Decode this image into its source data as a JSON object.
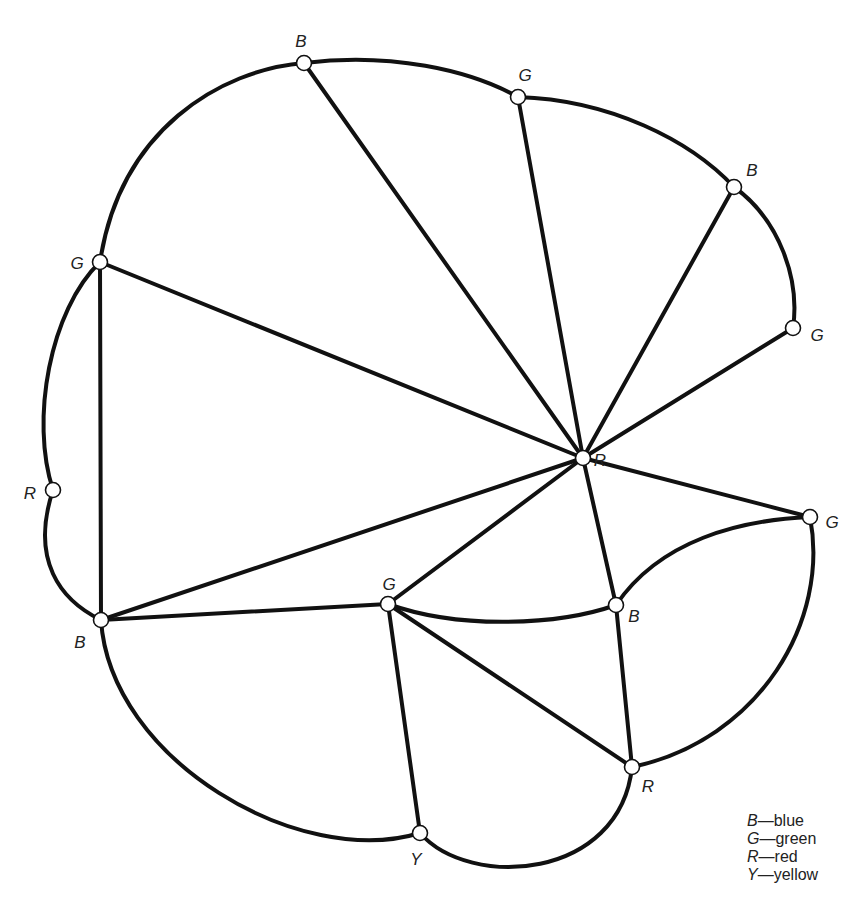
{
  "diagram": {
    "type": "planar-graph-coloring",
    "nodes": [
      {
        "id": "n1",
        "color_letter": "B",
        "x": 304,
        "y": 63,
        "lx": 301,
        "ly": 43
      },
      {
        "id": "n2",
        "color_letter": "G",
        "x": 518,
        "y": 97,
        "lx": 525,
        "ly": 77
      },
      {
        "id": "n3",
        "color_letter": "B",
        "x": 734,
        "y": 187,
        "lx": 752,
        "ly": 172
      },
      {
        "id": "n4",
        "color_letter": "G",
        "x": 793,
        "y": 328,
        "lx": 817,
        "ly": 337
      },
      {
        "id": "n5",
        "color_letter": "G",
        "x": 100,
        "y": 262,
        "lx": 77,
        "ly": 265
      },
      {
        "id": "n6",
        "color_letter": "R",
        "x": 583,
        "y": 458,
        "lx": 600,
        "ly": 462
      },
      {
        "id": "n7",
        "color_letter": "R",
        "x": 53,
        "y": 490,
        "lx": 30,
        "ly": 495
      },
      {
        "id": "n8",
        "color_letter": "G",
        "x": 810,
        "y": 517,
        "lx": 832,
        "ly": 524
      },
      {
        "id": "n9",
        "color_letter": "B",
        "x": 101,
        "y": 620,
        "lx": 80,
        "ly": 644
      },
      {
        "id": "n10",
        "color_letter": "G",
        "x": 388,
        "y": 604,
        "lx": 389,
        "ly": 586
      },
      {
        "id": "n11",
        "color_letter": "B",
        "x": 616,
        "y": 605,
        "lx": 634,
        "ly": 618
      },
      {
        "id": "n12",
        "color_letter": "R",
        "x": 632,
        "y": 767,
        "lx": 648,
        "ly": 788
      },
      {
        "id": "n13",
        "color_letter": "Y",
        "x": 420,
        "y": 833,
        "lx": 416,
        "ly": 861
      }
    ],
    "edges": [
      {
        "from": "n5",
        "to": "n1",
        "path": "M100,262 C120,130 220,70 304,63"
      },
      {
        "from": "n1",
        "to": "n2",
        "path": "M304,63 C390,52 470,70 518,97"
      },
      {
        "from": "n2",
        "to": "n3",
        "path": "M518,97 C610,100 690,140 734,187"
      },
      {
        "from": "n3",
        "to": "n4",
        "path": "M734,187 C780,220 800,280 793,328"
      },
      {
        "from": "n5",
        "to": "n7",
        "path": "M100,262 C50,310 30,420 53,490"
      },
      {
        "from": "n7",
        "to": "n9",
        "path": "M53,490 C30,560 60,600 101,620"
      },
      {
        "from": "n5",
        "to": "n9",
        "path": "M100,262 L101,620"
      },
      {
        "from": "n5",
        "to": "n6",
        "path": "M100,262 L583,458"
      },
      {
        "from": "n1",
        "to": "n6",
        "path": "M304,63 L583,458"
      },
      {
        "from": "n2",
        "to": "n6",
        "path": "M518,97 L583,458"
      },
      {
        "from": "n3",
        "to": "n6",
        "path": "M734,187 L583,458"
      },
      {
        "from": "n4",
        "to": "n6",
        "path": "M793,328 L583,458"
      },
      {
        "from": "n6",
        "to": "n8",
        "path": "M583,458 L810,517"
      },
      {
        "from": "n9",
        "to": "n6",
        "path": "M101,620 L583,458"
      },
      {
        "from": "n10",
        "to": "n6",
        "path": "M388,604 L583,458"
      },
      {
        "from": "n6",
        "to": "n11",
        "path": "M583,458 L616,605"
      },
      {
        "from": "n9",
        "to": "n10",
        "path": "M101,620 L388,604"
      },
      {
        "from": "n10",
        "to": "n11",
        "path": "M388,604 C460,630 560,625 616,605"
      },
      {
        "from": "n11",
        "to": "n8",
        "path": "M616,605 C660,540 740,520 810,517"
      },
      {
        "from": "n8",
        "to": "n12",
        "path": "M810,517 C830,620 760,740 632,767"
      },
      {
        "from": "n11",
        "to": "n12",
        "path": "M616,605 L632,767"
      },
      {
        "from": "n10",
        "to": "n12",
        "path": "M388,604 L632,767"
      },
      {
        "from": "n10",
        "to": "n13",
        "path": "M388,604 L420,833"
      },
      {
        "from": "n9",
        "to": "n13",
        "path": "M101,620 C110,760 300,870 420,833"
      },
      {
        "from": "n13",
        "to": "n12",
        "path": "M420,833 C470,890 620,880 632,767"
      }
    ]
  },
  "legend": {
    "items": [
      {
        "key": "B",
        "label": "blue"
      },
      {
        "key": "G",
        "label": "green"
      },
      {
        "key": "R",
        "label": "red"
      },
      {
        "key": "Y",
        "label": "yellow"
      }
    ],
    "separator": "—"
  }
}
